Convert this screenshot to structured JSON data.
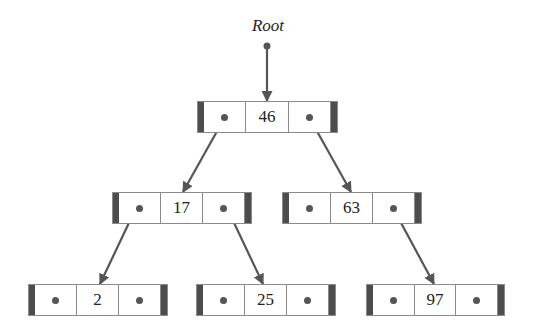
{
  "root_label": "Root",
  "colors": {
    "arrow": "#555555",
    "bar": "#4d4d4d",
    "border": "#8a8a8a",
    "text": "#222222"
  },
  "nodes": [
    {
      "id": "n46",
      "value": "46",
      "x": 197,
      "y": 101,
      "w": 141,
      "left_child": "n17",
      "right_child": "n63"
    },
    {
      "id": "n17",
      "value": "17",
      "x": 112,
      "y": 192,
      "w": 140,
      "left_child": "n2",
      "right_child": "n25"
    },
    {
      "id": "n63",
      "value": "63",
      "x": 282,
      "y": 192,
      "w": 140,
      "left_child": null,
      "right_child": "n97"
    },
    {
      "id": "n2",
      "value": "2",
      "x": 28,
      "y": 284,
      "w": 140,
      "left_child": null,
      "right_child": null
    },
    {
      "id": "n25",
      "value": "25",
      "x": 196,
      "y": 284,
      "w": 140,
      "left_child": null,
      "right_child": null
    },
    {
      "id": "n97",
      "value": "97",
      "x": 366,
      "y": 284,
      "w": 139,
      "left_child": null,
      "right_child": null
    }
  ],
  "edges": [
    {
      "from": "root",
      "to": "n46",
      "x1": 267,
      "y1": 46,
      "x2": 267,
      "y2": 101
    },
    {
      "from": "n46",
      "to": "n17",
      "x1": 225,
      "y1": 117,
      "x2": 183,
      "y2": 192
    },
    {
      "from": "n46",
      "to": "n63",
      "x1": 309,
      "y1": 117,
      "x2": 351,
      "y2": 192
    },
    {
      "from": "n17",
      "to": "n2",
      "x1": 136,
      "y1": 208,
      "x2": 100,
      "y2": 284
    },
    {
      "from": "n17",
      "to": "n25",
      "x1": 227,
      "y1": 208,
      "x2": 263,
      "y2": 284
    },
    {
      "from": "n63",
      "to": "n97",
      "x1": 393,
      "y1": 208,
      "x2": 434,
      "y2": 284
    }
  ]
}
